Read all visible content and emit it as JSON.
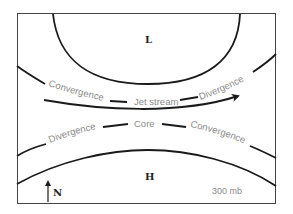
{
  "diagram": {
    "type": "jet-stream-convergence-divergence",
    "pressure_level": "300 mb",
    "low_label": "L",
    "high_label": "H",
    "north_label": "N",
    "upper_isobar_labels": {
      "left": "Convergence",
      "right": "Divergence"
    },
    "jet_label": "Jet stream",
    "lower_isobar_labels": {
      "left": "Divergence",
      "center": "Core",
      "right": "Convergence"
    },
    "colors": {
      "line": "#1a1a1a",
      "label": "#8a8a8a",
      "frame": "#444444"
    }
  }
}
